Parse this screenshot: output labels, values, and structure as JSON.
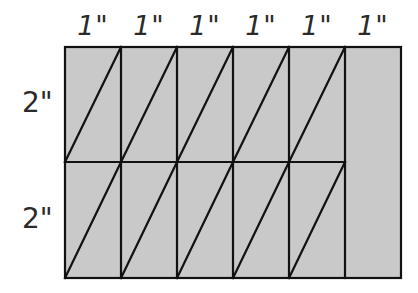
{
  "diagram": {
    "top_labels": [
      "1\"",
      "1\"",
      "1\"",
      "1\"",
      "1\"",
      "1\""
    ],
    "side_labels": [
      "2\"",
      "2\""
    ],
    "columns": 6,
    "rows": 2,
    "column_width_in": 1,
    "row_height_in": 2,
    "fill_color": "#c9c9c9",
    "line_color": "#111111",
    "triangulated_cells": {
      "top_row": [
        1,
        2,
        3,
        4,
        5
      ],
      "bottom_row": [
        1,
        2,
        3,
        4,
        5
      ]
    },
    "plain_strip": "rightmost 1\" by 4\" column"
  }
}
